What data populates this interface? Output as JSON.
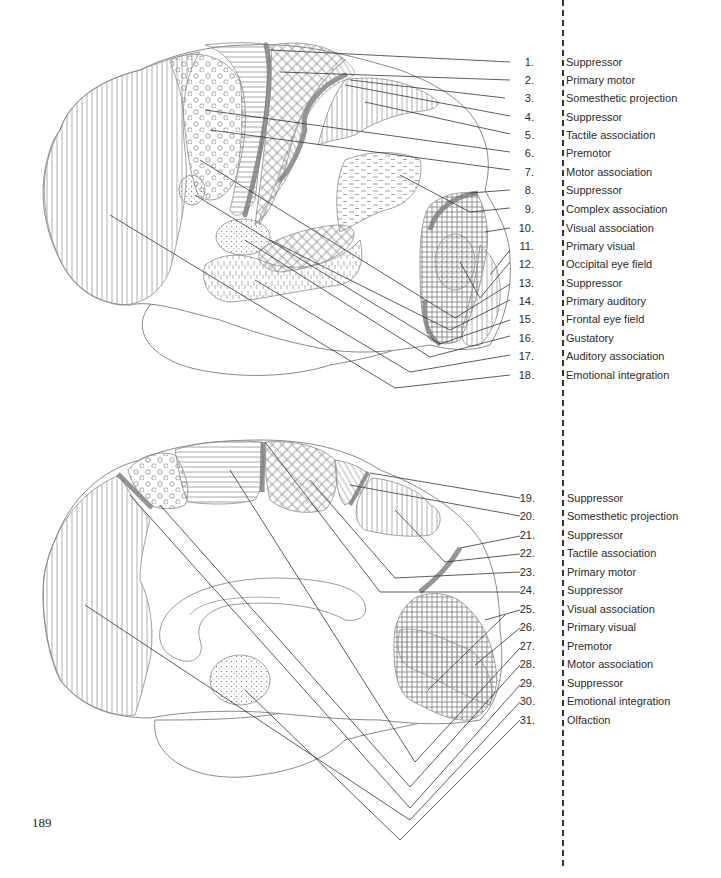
{
  "page": {
    "page_number": "189"
  },
  "lateral_view": {
    "name": "Lateral surface of brain",
    "labels": [
      {
        "num": "1.",
        "name": "Suppressor"
      },
      {
        "num": "2.",
        "name": "Primary motor"
      },
      {
        "num": "3.",
        "name": "Somesthetic projection"
      },
      {
        "num": "4.",
        "name": "Suppressor"
      },
      {
        "num": "5.",
        "name": "Tactile association"
      },
      {
        "num": "6.",
        "name": "Premotor"
      },
      {
        "num": "7.",
        "name": "Motor association"
      },
      {
        "num": "8.",
        "name": "Suppressor"
      },
      {
        "num": "9.",
        "name": "Complex association"
      },
      {
        "num": "10.",
        "name": "Visual association"
      },
      {
        "num": "11.",
        "name": "Primary visual"
      },
      {
        "num": "12.",
        "name": "Occipital eye field"
      },
      {
        "num": "13.",
        "name": "Suppressor"
      },
      {
        "num": "14.",
        "name": "Primary auditory"
      },
      {
        "num": "15.",
        "name": "Frontal eye field"
      },
      {
        "num": "16.",
        "name": "Gustatory"
      },
      {
        "num": "17.",
        "name": "Auditory association"
      },
      {
        "num": "18.",
        "name": "Emotional integration"
      }
    ]
  },
  "medial_view": {
    "name": "Medial surface of brain",
    "labels": [
      {
        "num": "19.",
        "name": "Suppressor"
      },
      {
        "num": "20.",
        "name": "Somesthetic projection"
      },
      {
        "num": "21.",
        "name": "Suppressor"
      },
      {
        "num": "22.",
        "name": "Tactile association"
      },
      {
        "num": "23.",
        "name": "Primary motor"
      },
      {
        "num": "24.",
        "name": "Suppressor"
      },
      {
        "num": "25.",
        "name": "Visual association"
      },
      {
        "num": "26.",
        "name": "Primary visual"
      },
      {
        "num": "27.",
        "name": "Premotor"
      },
      {
        "num": "28.",
        "name": "Motor association"
      },
      {
        "num": "29.",
        "name": "Suppressor"
      },
      {
        "num": "30.",
        "name": "Emotional integration"
      },
      {
        "num": "31.",
        "name": "Olfaction"
      }
    ]
  },
  "colors": {
    "outline": "#8a8a8a",
    "hatch": "#9a9a9a",
    "suppressor_band": "#7a7a7a",
    "leader_line": "#333333",
    "text": "#2a2a2a"
  }
}
